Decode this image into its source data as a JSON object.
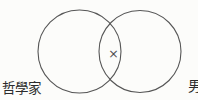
{
  "diagram": {
    "type": "venn",
    "left_circle_label": "哲學家",
    "right_circle_label": "男",
    "intersection_marker": "×",
    "colors": {
      "circle_stroke": "#565656",
      "text": "#2c2c2c",
      "background": "#fcfcfa"
    }
  }
}
